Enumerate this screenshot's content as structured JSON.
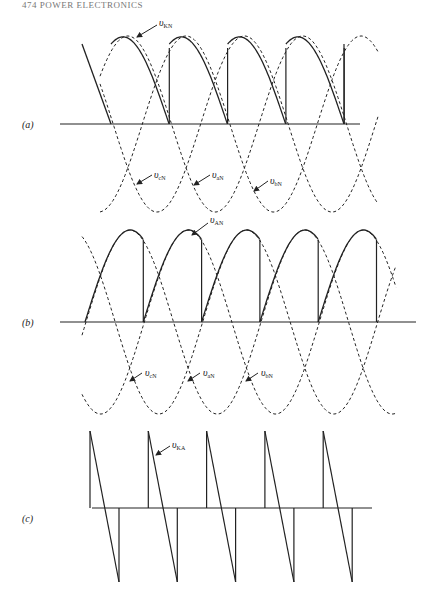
{
  "header": {
    "text": "474   POWER ELECTRONICS"
  },
  "panels": [
    {
      "id": "a",
      "label": "(a)",
      "curve": "v_KN",
      "phases": [
        "v_cN",
        "v_aN",
        "v_bN"
      ]
    },
    {
      "id": "b",
      "label": "(b)",
      "curve": "v_AN",
      "phases": [
        "v_cN",
        "v_aN",
        "v_bN"
      ]
    },
    {
      "id": "c",
      "label": "(c)",
      "curve": "v_KA"
    }
  ],
  "labels": {
    "a_main": "υ",
    "a_main_sub": "KN",
    "a_p1": "υ",
    "a_p1_sub": "cN",
    "a_p2": "υ",
    "a_p2_sub": "aN",
    "a_p3": "υ",
    "a_p3_sub": "bN",
    "b_main": "υ",
    "b_main_sub": "AN",
    "b_p1": "υ",
    "b_p1_sub": "cN",
    "b_p2": "υ",
    "b_p2_sub": "aN",
    "b_p3": "υ",
    "b_p3_sub": "bN",
    "c_main": "υ",
    "c_main_sub": "KA",
    "pa": "(a)",
    "pb": "(b)",
    "pc": "(c)"
  }
}
